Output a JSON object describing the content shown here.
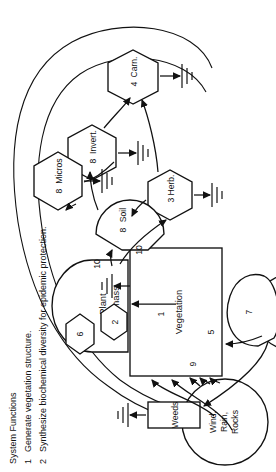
{
  "diagram": {
    "source_circles": [
      {
        "id": "wind-rain-rocks",
        "label": "Wind,\nRain,\nRocks",
        "lines": [
          "Wind,",
          "Rain,",
          "Rocks"
        ]
      },
      {
        "id": "sun",
        "label": "Sun",
        "lines": [
          "Sun"
        ]
      }
    ],
    "tank": {
      "id": "plant-biomass",
      "lines": [
        "Plant",
        "Biomass"
      ]
    },
    "boxes": [
      {
        "id": "vegetation",
        "label": "Vegetation"
      },
      {
        "id": "weeds",
        "label": "Weeds"
      }
    ],
    "hexagons": [
      {
        "id": "carnivores",
        "number": "4",
        "label": "Carn."
      },
      {
        "id": "herbivores",
        "number": "3",
        "label": "Herb."
      },
      {
        "id": "invertebrates",
        "number": "8",
        "label": "Invert."
      },
      {
        "id": "soil",
        "number": "8",
        "label": "Soil"
      },
      {
        "id": "microbes",
        "number": "8",
        "label": "Micros"
      },
      {
        "id": "interaction-six",
        "number": "6",
        "label": ""
      },
      {
        "id": "interaction-two",
        "number": "2",
        "label": ""
      }
    ],
    "flow_numbers": [
      "1",
      "5",
      "7",
      "9",
      "10",
      "10"
    ],
    "ground_symbols": 5
  },
  "legend": {
    "heading": "System Functions",
    "items": [
      {
        "number": "1",
        "text": "Generate vegetation structure."
      },
      {
        "number": "2",
        "text": "Synthesize biochemical diversity for epidemic protection."
      }
    ]
  },
  "colors": {
    "ink": "#111111",
    "paper": "#ffffff"
  }
}
